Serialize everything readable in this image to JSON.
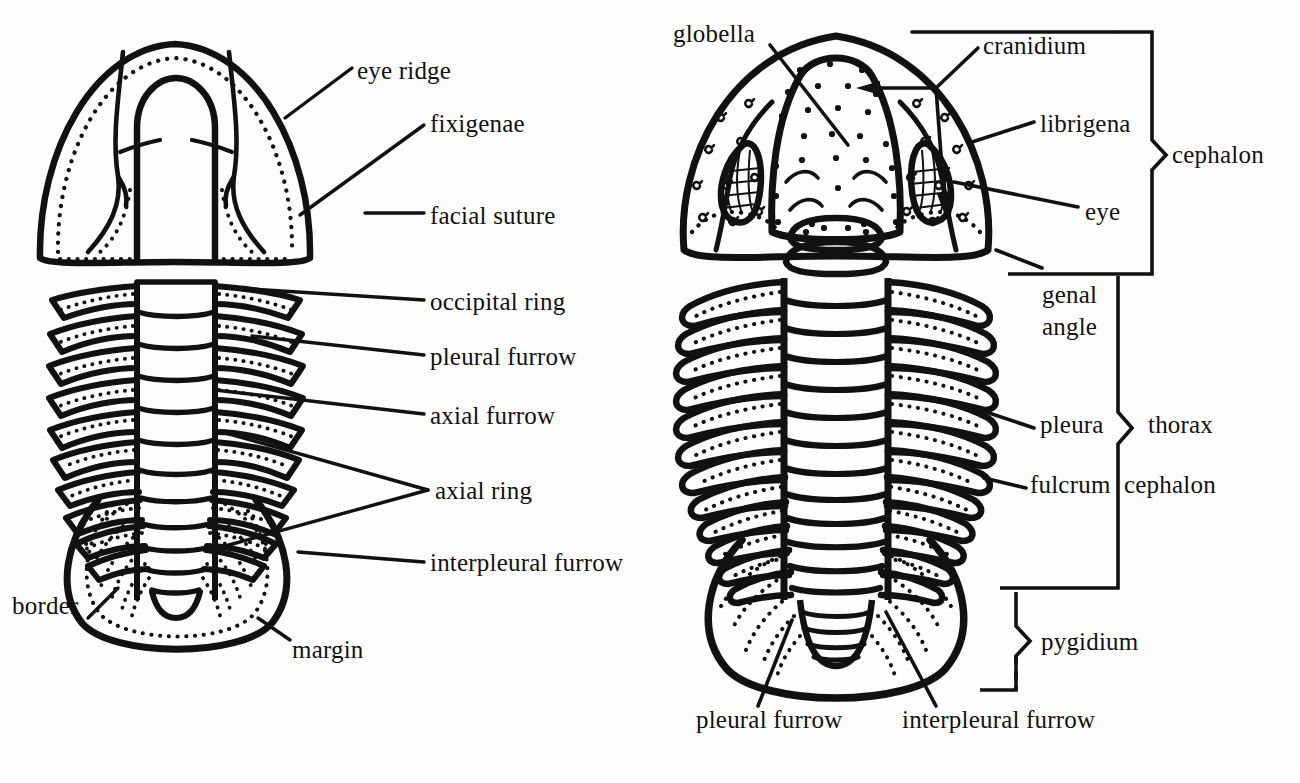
{
  "figure": {
    "title_present": false,
    "background_color": "#fdfdfd",
    "ink_color": "#111111",
    "panels": [
      {
        "id": "left",
        "name": "left-trilobite",
        "thorax_segments": 10,
        "pygidium_ribs": 7
      },
      {
        "id": "right",
        "name": "right-trilobite",
        "thorax_segments": 12,
        "pygidium_ribs": 8
      }
    ]
  },
  "left_labels": [
    {
      "key": "eye_ridge",
      "text": "eye ridge",
      "x": 357,
      "y": 57
    },
    {
      "key": "fixigenae",
      "text": "fixigenae",
      "x": 430,
      "y": 110
    },
    {
      "key": "facial_suture",
      "text": "facial suture",
      "x": 430,
      "y": 202
    },
    {
      "key": "occipital_ring",
      "text": "occipital ring",
      "x": 430,
      "y": 295
    },
    {
      "key": "pleural_furrow",
      "text": "pleural furrow",
      "x": 430,
      "y": 345
    },
    {
      "key": "axial_furrow",
      "text": "axial furrow",
      "x": 430,
      "y": 405
    },
    {
      "key": "axial_ring",
      "text": "axial ring",
      "x": 435,
      "y": 477
    },
    {
      "key": "interpleural_furrow",
      "text": "interpleural furrow",
      "x": 430,
      "y": 550
    },
    {
      "key": "border",
      "text": "border",
      "x": 12,
      "y": 592
    },
    {
      "key": "margin",
      "text": "margin",
      "x": 292,
      "y": 636
    }
  ],
  "right_labels": [
    {
      "key": "globella",
      "text": "globella",
      "x": 673,
      "y": 20
    },
    {
      "key": "cranidium",
      "text": "cranidium",
      "x": 983,
      "y": 32
    },
    {
      "key": "librigena",
      "text": "librigena",
      "x": 1040,
      "y": 110
    },
    {
      "key": "eye",
      "text": "eye",
      "x": 1085,
      "y": 198
    },
    {
      "key": "cephalon_bracket",
      "text": "cephalon",
      "x": 1172,
      "y": 143
    },
    {
      "key": "genal_angle",
      "text": "genal\nangle",
      "x": 1042,
      "y": 281
    },
    {
      "key": "pleura",
      "text": "pleura",
      "x": 1040,
      "y": 423
    },
    {
      "key": "thorax_bracket",
      "text": "thorax",
      "x": 1148,
      "y": 423
    },
    {
      "key": "fulcrum",
      "text": "fulcrum",
      "x": 1030,
      "y": 481
    },
    {
      "key": "cephalon_lower",
      "text": "cephalon",
      "x": 1124,
      "y": 481
    },
    {
      "key": "pygidium_bracket",
      "text": "pygidium",
      "x": 1041,
      "y": 638
    },
    {
      "key": "pleural_furrow_b",
      "text": "pleural furrow",
      "x": 696,
      "y": 717
    },
    {
      "key": "interpleural_furrow_b",
      "text": "interpleural furrow",
      "x": 902,
      "y": 717
    }
  ],
  "brackets": [
    {
      "key": "cephalon",
      "label": "cephalon",
      "style": "solid"
    },
    {
      "key": "thorax",
      "label": "thorax",
      "style": "solid"
    },
    {
      "key": "pygidium",
      "label": "pygidium",
      "style": "dashed-bottom"
    }
  ]
}
